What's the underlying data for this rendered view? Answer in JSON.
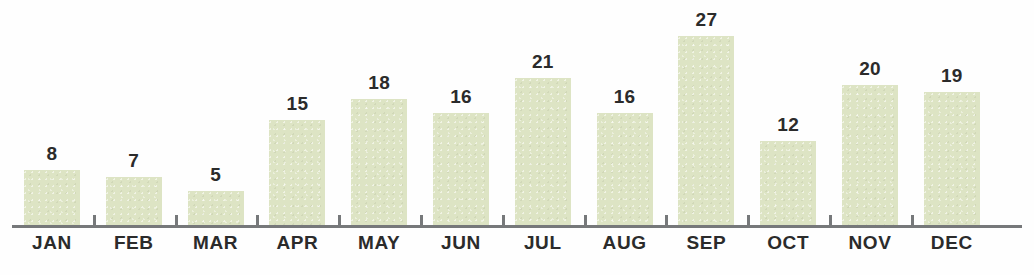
{
  "chart_data": {
    "type": "bar",
    "title": "",
    "subtitle": "",
    "xlabel": "",
    "ylabel": "",
    "categories": [
      "JAN",
      "FEB",
      "MAR",
      "APR",
      "MAY",
      "JUN",
      "JUL",
      "AUG",
      "SEP",
      "OCT",
      "NOV",
      "DEC"
    ],
    "values": [
      8,
      7,
      5,
      15,
      18,
      16,
      21,
      16,
      27,
      12,
      20,
      19
    ],
    "data_labels": [
      "8",
      "7",
      "5",
      "15",
      "18",
      "16",
      "21",
      "16",
      "27",
      "12",
      "20",
      "19"
    ],
    "ylim": [
      0,
      27
    ],
    "grid": false,
    "legend": null,
    "legend_position": "none",
    "annotations": [],
    "axis": {
      "y_axis_visible": false,
      "y_tick_labels": [],
      "x_axis_visible": true,
      "x_ticks_between_categories": true
    }
  },
  "style": {
    "bar_color": "#dde4c4",
    "axis_color": "#76787a",
    "label_color": "#2b2b2b",
    "background": "#fefefe"
  }
}
